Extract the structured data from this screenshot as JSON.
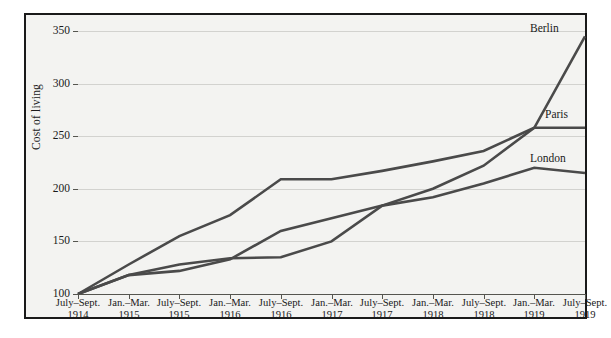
{
  "figure": {
    "background_color": "#f3f3f1",
    "frame_color": "#1a1a1a",
    "line_color": "#4a4a4a",
    "grid_color": "#d2d2cf"
  },
  "axis": {
    "ylabel": "Cost of living",
    "yticks": [
      "350",
      "300",
      "250",
      "200",
      "150",
      "100"
    ]
  },
  "labels": {
    "berlin": "Berlin",
    "paris": "Paris",
    "london": "London"
  },
  "xticks": [
    {
      "season": "July–Sept.",
      "year": "1914"
    },
    {
      "season": "Jan.–Mar.",
      "year": "1915"
    },
    {
      "season": "July–Sept.",
      "year": "1915"
    },
    {
      "season": "Jan.–Mar.",
      "year": "1916"
    },
    {
      "season": "July–Sept.",
      "year": "1916"
    },
    {
      "season": "Jan.–Mar.",
      "year": "1917"
    },
    {
      "season": "July–Sept.",
      "year": "1917"
    },
    {
      "season": "Jan.–Mar.",
      "year": "1918"
    },
    {
      "season": "July–Sept.",
      "year": "1918"
    },
    {
      "season": "Jan.–Mar.",
      "year": "1919"
    },
    {
      "season": "July–Sept.",
      "year": "1919"
    }
  ],
  "chart_data": {
    "type": "line",
    "title": "",
    "xlabel": "",
    "ylabel": "Cost of living",
    "ylim": [
      100,
      350
    ],
    "yticks": [
      100,
      150,
      200,
      250,
      300,
      350
    ],
    "grid": true,
    "legend": "inline-end-of-line",
    "categories": [
      "July–Sept. 1914",
      "Jan.–Mar. 1915",
      "July–Sept. 1915",
      "Jan.–Mar. 1916",
      "July–Sept. 1916",
      "Jan.–Mar. 1917",
      "July–Sept. 1917",
      "Jan.–Mar. 1918",
      "July–Sept. 1918",
      "Jan.–Mar. 1919",
      "July–Sept. 1919"
    ],
    "series": [
      {
        "name": "Berlin",
        "values": [
          100,
          128,
          155,
          175,
          209,
          209,
          217,
          226,
          236,
          258,
          345
        ]
      },
      {
        "name": "Paris",
        "values": [
          100,
          118,
          128,
          134,
          135,
          150,
          184,
          200,
          222,
          258,
          258
        ]
      },
      {
        "name": "London",
        "values": [
          100,
          118,
          122,
          133,
          160,
          172,
          184,
          192,
          205,
          220,
          215
        ]
      }
    ]
  }
}
